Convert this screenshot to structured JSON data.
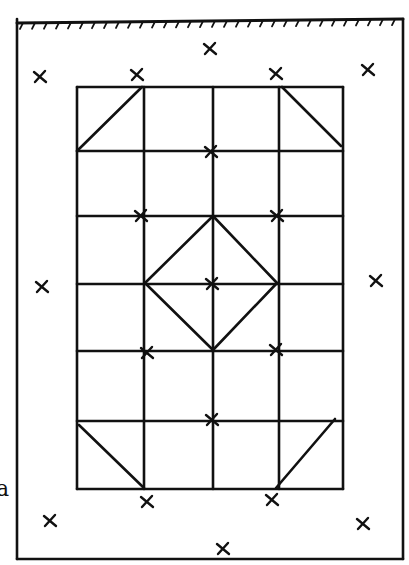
{
  "diagram": {
    "style": {
      "ink": "#111111",
      "paper": "#ffffff",
      "stroke_width": 2.6
    },
    "side_label": {
      "text": "a",
      "x": -4,
      "y": 478
    },
    "outer_border": {
      "x1": 17,
      "y1": 19,
      "x2": 403,
      "y2": 559,
      "top_edge": "hatched"
    },
    "grid": {
      "columns_x": [
        77,
        144,
        213,
        279,
        343
      ],
      "rows_y": [
        87,
        151,
        216,
        284,
        351,
        421,
        489
      ]
    },
    "diagonals": [
      {
        "from": [
          77,
          151
        ],
        "to": [
          142,
          87
        ],
        "label": "top-left corner triangle"
      },
      {
        "from": [
          282,
          87
        ],
        "to": [
          341,
          146
        ],
        "label": "top-right corner triangle"
      },
      {
        "from": [
          213,
          216
        ],
        "to": [
          145,
          283
        ],
        "label": "diamond top-left"
      },
      {
        "from": [
          213,
          216
        ],
        "to": [
          277,
          283
        ],
        "label": "diamond top-right"
      },
      {
        "from": [
          145,
          283
        ],
        "to": [
          213,
          350
        ],
        "label": "diamond bottom-left"
      },
      {
        "from": [
          277,
          283
        ],
        "to": [
          213,
          350
        ],
        "label": "diamond bottom-right"
      },
      {
        "from": [
          79,
          425
        ],
        "to": [
          144,
          488
        ],
        "label": "bottom-left corner triangle"
      },
      {
        "from": [
          335,
          419
        ],
        "to": [
          276,
          488
        ],
        "label": "bottom-right corner triangle"
      }
    ],
    "x_marks": [
      {
        "x": 210,
        "y": 49
      },
      {
        "x": 40,
        "y": 77
      },
      {
        "x": 137,
        "y": 75
      },
      {
        "x": 276,
        "y": 74
      },
      {
        "x": 368,
        "y": 70
      },
      {
        "x": 211,
        "y": 152
      },
      {
        "x": 141,
        "y": 216
      },
      {
        "x": 277,
        "y": 216
      },
      {
        "x": 42,
        "y": 287
      },
      {
        "x": 212,
        "y": 284
      },
      {
        "x": 376,
        "y": 281
      },
      {
        "x": 147,
        "y": 353
      },
      {
        "x": 276,
        "y": 350
      },
      {
        "x": 212,
        "y": 420
      },
      {
        "x": 147,
        "y": 502
      },
      {
        "x": 272,
        "y": 500
      },
      {
        "x": 50,
        "y": 521
      },
      {
        "x": 363,
        "y": 524
      },
      {
        "x": 223,
        "y": 549
      }
    ]
  }
}
